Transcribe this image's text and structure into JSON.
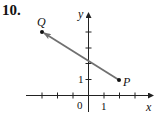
{
  "problem": {
    "number": "10."
  },
  "axes": {
    "x_label": "x",
    "y_label": "y",
    "origin_label": "0",
    "x_tick_label": "1",
    "y_tick_label": "1",
    "x_ticks": [
      -3,
      -2,
      -1,
      1,
      2,
      3
    ],
    "y_ticks": [
      1,
      2,
      3,
      4
    ]
  },
  "points": [
    {
      "name": "P",
      "x": 2,
      "y": 1
    },
    {
      "name": "Q",
      "x": -3,
      "y": 4
    }
  ],
  "vector": {
    "from": "P",
    "to": "Q",
    "color": "#707070"
  },
  "colors": {
    "axis": "#222222",
    "vector": "#707070",
    "point": "#111111"
  }
}
